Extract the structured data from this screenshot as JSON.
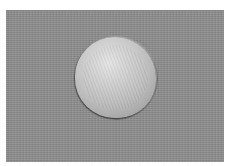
{
  "image": {
    "description": "Grayscale micrograph of a single spherical particle on a textured gray background",
    "background_color": "#8e8e8e",
    "border_color": "#ffffff",
    "subject": {
      "shape": "sphere",
      "highlight_color": "#e4e4e4",
      "rim_color": "#555555"
    }
  }
}
